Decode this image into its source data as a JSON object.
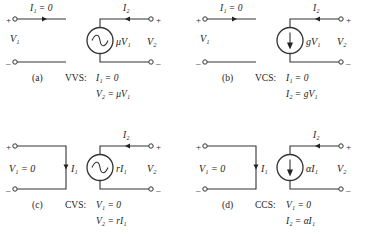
{
  "figure": {
    "panels": [
      {
        "id": "a",
        "caption": "(a)",
        "type_label": "VVS:",
        "eq1": "I₁ = 0",
        "eq2": "V₂ = μV₁",
        "input_label": "V₁",
        "input_current_label": "I₁ = 0",
        "output_current_label": "I₂",
        "output_label": "V₂",
        "source_label": "μV₁",
        "source_kind": "voltage",
        "input_kind": "open"
      },
      {
        "id": "b",
        "caption": "(b)",
        "type_label": "VCS:",
        "eq1": "I₁ = 0",
        "eq2": "I₂ = gV₁",
        "input_label": "V₁",
        "input_current_label": "I₁ = 0",
        "output_current_label": "I₂",
        "output_label": "V₂",
        "source_label": "gV₁",
        "source_kind": "current",
        "input_kind": "open"
      },
      {
        "id": "c",
        "caption": "(c)",
        "type_label": "CVS:",
        "eq1": "V₁ = 0",
        "eq2": "V₂ = rI₁",
        "input_label": "V₁ = 0",
        "input_current_label": "I₁",
        "output_current_label": "I₂",
        "output_label": "V₂",
        "source_label": "rI₁",
        "source_kind": "voltage",
        "input_kind": "short"
      },
      {
        "id": "d",
        "caption": "(d)",
        "type_label": "CCS:",
        "eq1": "V₁ = 0",
        "eq2": "I₂ = αI₁",
        "input_label": "V₁ = 0",
        "input_current_label": "I₁",
        "output_current_label": "I₂",
        "output_label": "V₂",
        "source_label": "αI₁",
        "source_kind": "current",
        "input_kind": "short"
      }
    ],
    "terminal_plus": "+",
    "terminal_minus": "–"
  }
}
